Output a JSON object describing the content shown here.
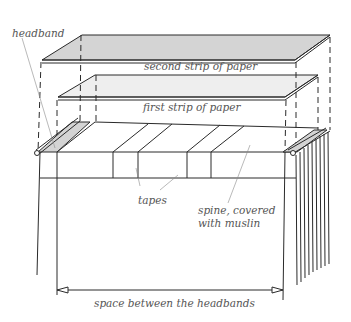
{
  "diagram": {
    "labels": {
      "headband": "headband",
      "second_strip": "second strip of paper",
      "first_strip": "first strip of paper",
      "tapes": "tapes",
      "spine_line1": "spine, covered",
      "spine_line2": "with muslin",
      "space": "space between the headbands"
    },
    "colors": {
      "line": "#2a2a2a",
      "fill": "#d4d4d4",
      "text": "#555555",
      "leader": "#8a8a8a"
    }
  }
}
